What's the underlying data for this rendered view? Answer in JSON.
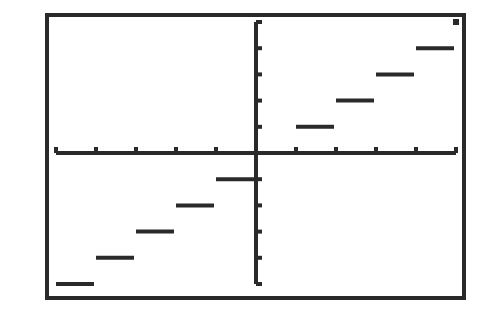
{
  "chart_data": {
    "type": "line",
    "title": "",
    "function": "y = int(x)",
    "xlabel": "",
    "ylabel": "",
    "xlim": [
      -5,
      5
    ],
    "ylim": [
      -5,
      5
    ],
    "xscale": 1,
    "yscale": 1,
    "grid": false,
    "legend": null,
    "x_ticks": [
      -5,
      -4,
      -3,
      -2,
      -1,
      0,
      1,
      2,
      3,
      4,
      5
    ],
    "y_ticks": [
      -5,
      -4,
      -3,
      -2,
      -1,
      0,
      1,
      2,
      3,
      4,
      5
    ],
    "segments": [
      {
        "x_start": -5,
        "x_end": -4,
        "y": -5
      },
      {
        "x_start": -4,
        "x_end": -3,
        "y": -4
      },
      {
        "x_start": -3,
        "x_end": -2,
        "y": -3
      },
      {
        "x_start": -2,
        "x_end": -1,
        "y": -2
      },
      {
        "x_start": -1,
        "x_end": 0,
        "y": -1
      },
      {
        "x_start": 0,
        "x_end": 1,
        "y": 0
      },
      {
        "x_start": 1,
        "x_end": 2,
        "y": 1
      },
      {
        "x_start": 2,
        "x_end": 3,
        "y": 2
      },
      {
        "x_start": 3,
        "x_end": 4,
        "y": 3
      },
      {
        "x_start": 4,
        "x_end": 5,
        "y": 4
      }
    ],
    "points": [
      {
        "x": 5,
        "y": 5
      }
    ]
  },
  "style": {
    "ink": "#2a2a2a",
    "background": "#ffffff"
  }
}
